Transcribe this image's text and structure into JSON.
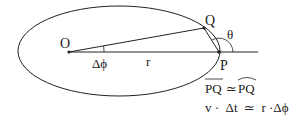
{
  "diagram": {
    "labels": {
      "origin": "O",
      "point_q": "Q",
      "point_p": "P",
      "angle_theta": "θ",
      "delta_phi": "Δϕ",
      "radius": "r"
    },
    "equations": {
      "eq1_left": "PQ",
      "eq1_op": "≃",
      "eq1_right": "PQ",
      "eq2": "v ·  Δt  ≃  r ·Δϕ"
    },
    "colors": {
      "stroke": "#222222",
      "background": "#ffffff"
    }
  }
}
